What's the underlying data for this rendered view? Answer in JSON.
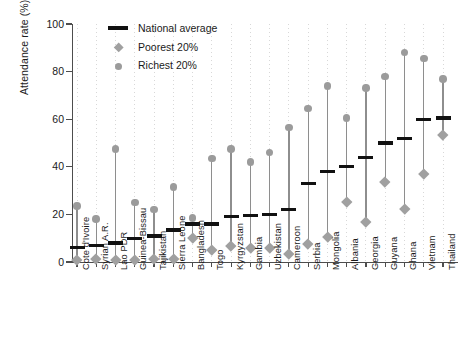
{
  "chart_data": {
    "type": "scatter",
    "title": "",
    "xlabel": "",
    "ylabel": "Attendance rate (%)",
    "ylim": [
      0,
      100
    ],
    "yticks": [
      0,
      20,
      40,
      60,
      80,
      100
    ],
    "grid": false,
    "legend_position": "top-center",
    "categories": [
      "Cote d'Ivoire",
      "Syrian A.R.",
      "Lao PDR",
      "Guinea-Bissau",
      "Tajikistan",
      "Sierra Leone",
      "Bangladesh",
      "Togo",
      "Kyrgyzstan",
      "Gambia",
      "Uzbekistan",
      "Cameroon",
      "Serbia",
      "Mongolia",
      "Albania",
      "Georgia",
      "Guyana",
      "Ghana",
      "Vietnam",
      "Thailand"
    ],
    "series": [
      {
        "name": "National average",
        "marker": "bar",
        "color": "#111111",
        "values": [
          6,
          7,
          8,
          10,
          11,
          13.5,
          16,
          16,
          19,
          19.5,
          20,
          22,
          33,
          38,
          40,
          44,
          50,
          52,
          60,
          60.5
        ]
      },
      {
        "name": "Poorest 20%",
        "marker": "diamond",
        "color": "#a0a0a0",
        "values": [
          1,
          1.5,
          1,
          1,
          1.5,
          1.5,
          10,
          5,
          7,
          6,
          6,
          3.5,
          7.5,
          10.5,
          25.5,
          17,
          33.5,
          22.5,
          37,
          53.5
        ]
      },
      {
        "name": "Richest 20%",
        "marker": "circle",
        "color": "#9b9b9b",
        "values": [
          23.5,
          18,
          47.5,
          25,
          22,
          31.5,
          18.5,
          43.5,
          47.5,
          42,
          46,
          56.5,
          64.5,
          74,
          60.5,
          73,
          78,
          88,
          85.5,
          77
        ]
      }
    ]
  },
  "legend": {
    "items": [
      {
        "label": "National average",
        "marker": "bar"
      },
      {
        "label": "Poorest 20%",
        "marker": "diamond"
      },
      {
        "label": "Richest 20%",
        "marker": "circle"
      }
    ]
  }
}
